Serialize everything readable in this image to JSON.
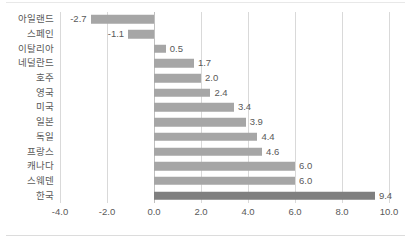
{
  "chart_data": {
    "type": "bar",
    "orientation": "horizontal",
    "title": "",
    "subtitle": "",
    "xlabel": "",
    "ylabel": "",
    "xlim": [
      -4.0,
      10.0
    ],
    "xticks": [
      "-4.0",
      "-2.0",
      "0.0",
      "2.0",
      "4.0",
      "6.0",
      "8.0",
      "10.0"
    ],
    "xtick_values": [
      -4.0,
      -2.0,
      0.0,
      2.0,
      4.0,
      6.0,
      8.0,
      10.0
    ],
    "grid": true,
    "grid_axis": "x",
    "legend": null,
    "categories": [
      "아일랜드",
      "스페인",
      "이탈리아",
      "네덜란드",
      "호주",
      "영국",
      "미국",
      "일본",
      "독일",
      "프랑스",
      "캐나다",
      "스웨덴",
      "한국"
    ],
    "values": [
      -2.7,
      -1.1,
      0.5,
      1.7,
      2.0,
      2.4,
      3.4,
      3.9,
      4.4,
      4.6,
      6.0,
      6.0,
      9.4
    ],
    "data_labels": [
      "-2.7",
      "-1.1",
      "0.5",
      "1.7",
      "2.0",
      "2.4",
      "3.4",
      "3.9",
      "4.4",
      "4.6",
      "6.0",
      "6.0",
      "9.4"
    ],
    "highlight_category": "한국",
    "colors": {
      "bar": "#a6a6a6",
      "bar_highlight": "#7f7f7f",
      "gridline": "#d9d9d9",
      "zero_axis": "#bfbfbf",
      "text": "#595959",
      "background": "#ffffff"
    }
  }
}
